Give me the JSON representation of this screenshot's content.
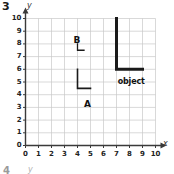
{
  "problem": {
    "number": "3"
  },
  "axes": {
    "x_label": "x",
    "y_label": "y",
    "x_ticks": [
      "0",
      "1",
      "2",
      "3",
      "4",
      "5",
      "6",
      "7",
      "8",
      "9",
      "10"
    ],
    "y_ticks": [
      "0",
      "1",
      "2",
      "3",
      "4",
      "5",
      "6",
      "7",
      "8",
      "9",
      "10"
    ],
    "xlim": [
      0,
      10
    ],
    "ylim": [
      0,
      10
    ],
    "grid": true,
    "grid_color": "#c9c9c9",
    "axis_color": "#3a3a3a"
  },
  "labels": {
    "shape_a": "A",
    "shape_b": "B",
    "object": "object"
  },
  "next_figure": {
    "number": "4",
    "y_label": "y"
  },
  "chart_data": {
    "type": "scatter",
    "title": "",
    "xlabel": "x",
    "ylabel": "y",
    "xlim": [
      0,
      10
    ],
    "ylim": [
      0,
      10
    ],
    "grid": true,
    "x": [
      0,
      1,
      2,
      3,
      4,
      5,
      6,
      7,
      8,
      9,
      10
    ],
    "y": [
      0,
      1,
      2,
      3,
      4,
      5,
      6,
      7,
      8,
      9,
      10
    ],
    "legend": [],
    "annotations": [
      {
        "text": "B",
        "x": 3.7,
        "y": 8.6
      },
      {
        "text": "A",
        "x": 4.5,
        "y": 3.6
      },
      {
        "text": "object",
        "x": 7.1,
        "y": 5.3
      }
    ],
    "shapes": [
      {
        "name": "object",
        "kind": "polyline",
        "stroke": "#1a1a1a",
        "stroke_width": 3,
        "points": [
          [
            7,
            10
          ],
          [
            7,
            6
          ],
          [
            9,
            6
          ]
        ]
      },
      {
        "name": "A",
        "kind": "polyline",
        "stroke": "#1a1a1a",
        "stroke_width": 1.6,
        "points": [
          [
            4,
            6
          ],
          [
            4,
            4.5
          ],
          [
            5,
            4.5
          ]
        ]
      },
      {
        "name": "B",
        "kind": "polyline",
        "stroke": "#1a1a1a",
        "stroke_width": 1.3,
        "points": [
          [
            4,
            8
          ],
          [
            4,
            7.5
          ],
          [
            4.5,
            7.5
          ]
        ]
      }
    ]
  }
}
